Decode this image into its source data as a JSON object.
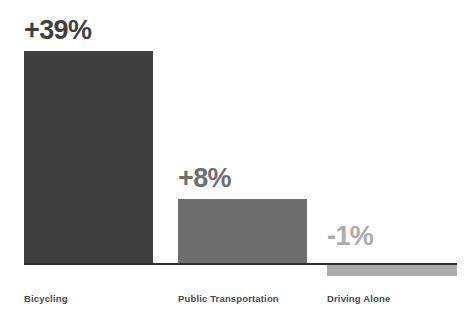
{
  "chart_data": {
    "type": "bar",
    "title": "",
    "subtitle": "",
    "xlabel": "",
    "ylabel": "",
    "grid": false,
    "legend": "none",
    "baseline_value": 0,
    "ylim": [
      -5,
      45
    ],
    "categories": [
      "Bicycling",
      "Public Transportation",
      "Driving Alone"
    ],
    "values": [
      39,
      8,
      -1
    ],
    "value_labels": [
      "+39%",
      "+8%",
      "-1%"
    ],
    "bar_colors": [
      "#3f3f3f",
      "#6e6e6e",
      "#ababab"
    ],
    "label_colors": [
      "#3f3f3f",
      "#6e6e6e",
      "#ababab"
    ],
    "category_label_color": "#4a4a4a",
    "baseline_color": "#2e2e2e",
    "background_color": "#ffffff",
    "bars": [
      {
        "category": "Bicycling",
        "value": 39,
        "value_label": "+39%",
        "bar_color": "#3f3f3f",
        "label_color": "#3f3f3f"
      },
      {
        "category": "Public Transportation",
        "value": 8,
        "value_label": "+8%",
        "bar_color": "#6e6e6e",
        "label_color": "#6e6e6e"
      },
      {
        "category": "Driving Alone",
        "value": -1,
        "value_label": "-1%",
        "bar_color": "#ababab",
        "label_color": "#ababab"
      }
    ]
  }
}
